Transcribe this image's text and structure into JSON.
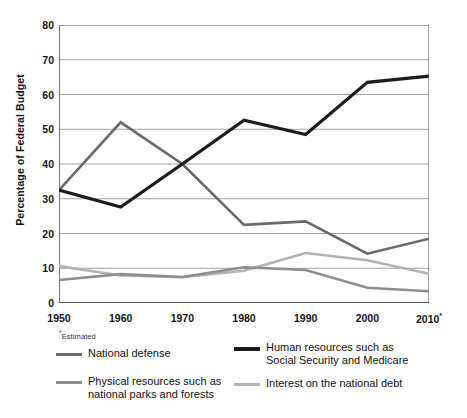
{
  "chart_data": {
    "type": "line",
    "title": "",
    "xlabel": "",
    "ylabel": "Percentage of Federal Budget",
    "x": [
      1950,
      1960,
      1970,
      1980,
      1990,
      2000,
      2010
    ],
    "categories": [
      "1950",
      "1960",
      "1970",
      "1980",
      "1990",
      "2000",
      "2010*"
    ],
    "xlim": [
      1950,
      2010
    ],
    "ylim": [
      0,
      80
    ],
    "yticks": [
      0,
      10,
      20,
      30,
      40,
      50,
      60,
      70,
      80
    ],
    "ytick_labels": [
      "0",
      "10",
      "20",
      "30",
      "40",
      "50",
      "60",
      "70",
      "80"
    ],
    "grid": "horizontal",
    "legend_position": "below",
    "footnote": "*Estimated",
    "series": [
      {
        "name": "National defense",
        "color": "#6a6a6a",
        "width": 2.6,
        "values": [
          32.5,
          52.0,
          40.0,
          22.5,
          23.5,
          14.2,
          18.5
        ]
      },
      {
        "name": "Human resources such as\nSocial Security and Medicare",
        "color": "#1c1c1c",
        "width": 3.2,
        "values": [
          32.5,
          27.6,
          40.0,
          52.6,
          48.5,
          63.5,
          65.3
        ]
      },
      {
        "name": "Physical resources such as\nnational parks and forests",
        "color": "#8e8e8e",
        "width": 2.6,
        "values": [
          6.6,
          8.3,
          7.5,
          10.3,
          9.5,
          4.4,
          3.4
        ]
      },
      {
        "name": "Interest on the national debt",
        "color": "#b3b3b3",
        "width": 2.6,
        "values": [
          10.6,
          7.9,
          7.4,
          9.3,
          14.4,
          12.3,
          8.4
        ]
      }
    ]
  },
  "axes": {
    "y_label": "Percentage of Federal Budget",
    "y_ticks": [
      "80",
      "70",
      "60",
      "50",
      "40",
      "30",
      "20",
      "10",
      "0"
    ],
    "x_ticks": [
      "1950",
      "1960",
      "1970",
      "1980",
      "1990",
      "2000",
      "2010"
    ],
    "x_last_marker": "*"
  },
  "footnote": {
    "marker": "*",
    "text": "Estimated"
  },
  "legend": {
    "items": [
      {
        "label": "National defense",
        "color": "#6a6a6a"
      },
      {
        "label": "Human resources such as\nSocial Security and Medicare",
        "color": "#1c1c1c"
      },
      {
        "label": "Physical resources such as\nnational parks and forests",
        "color": "#8e8e8e"
      },
      {
        "label": "Interest on the national debt",
        "color": "#b3b3b3"
      }
    ]
  }
}
